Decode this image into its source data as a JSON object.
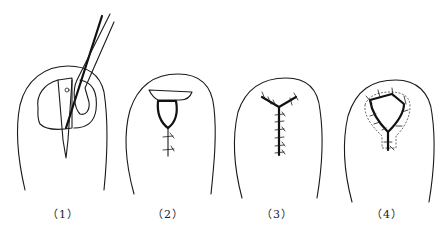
{
  "figure": {
    "panels": [
      {
        "id": 1,
        "label": "（1）",
        "description": "Nail incision with scalpel and retractor"
      },
      {
        "id": 2,
        "label": "（2）",
        "description": "Excised nail wedge with sutured incision"
      },
      {
        "id": 3,
        "label": "（3）",
        "description": "Y-shaped sutured closure"
      },
      {
        "id": 4,
        "label": "（4）",
        "description": "Triangular flap closure with dotted outline"
      }
    ],
    "colors": {
      "line": "#1a1a1a",
      "background": "#ffffff"
    }
  }
}
